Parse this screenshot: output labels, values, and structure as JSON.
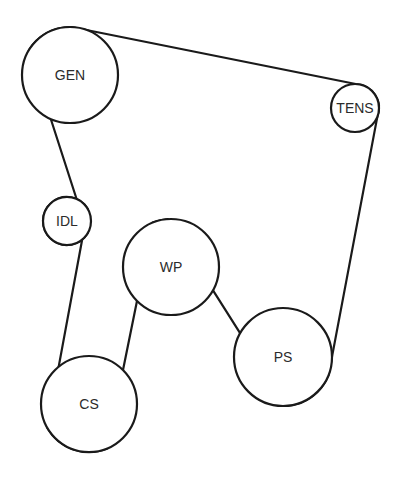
{
  "diagram": {
    "belt_color": "#1a1a1a",
    "text_color": "#2b2b2b",
    "pulleys": [
      {
        "id": "gen",
        "label": "GEN",
        "cx": 70,
        "cy": 75,
        "r": 48,
        "side": "out"
      },
      {
        "id": "tens",
        "label": "TENS",
        "cx": 355,
        "cy": 108,
        "r": 24,
        "side": "out"
      },
      {
        "id": "ps",
        "label": "PS",
        "cx": 283,
        "cy": 357,
        "r": 49,
        "side": "out"
      },
      {
        "id": "wp",
        "label": "WP",
        "cx": 171,
        "cy": 267,
        "r": 48,
        "side": "in"
      },
      {
        "id": "cs",
        "label": "CS",
        "cx": 89,
        "cy": 404,
        "r": 48,
        "side": "out"
      },
      {
        "id": "idl",
        "label": "IDL",
        "cx": 67,
        "cy": 221,
        "r": 24,
        "side": "in"
      }
    ]
  }
}
